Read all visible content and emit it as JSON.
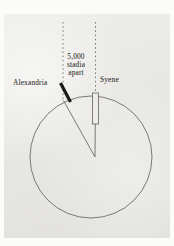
{
  "figure": {
    "name": "eratosthenes-earth-circumference-diagram",
    "type": "geometry-diagram",
    "background_color": "#e8e7e3",
    "ink_color": "#3b3b38"
  },
  "labels": {
    "alexandria": "Alexandria",
    "syene": "Syene",
    "distance_line1": "5,000",
    "distance_line2": "stadia",
    "distance_line3": "apart"
  },
  "diagram_data": {
    "earth_circle": {
      "center_x": 91,
      "center_y": 157,
      "radius": 61,
      "stroke": "#6e6c66",
      "stroke_width": 0.9,
      "fill": "none"
    },
    "sun_rays": [
      {
        "name": "sun-ray-alexandria",
        "x": 63,
        "y_top": 22,
        "y_bottom": 100,
        "style": "dotted"
      },
      {
        "name": "sun-ray-syene",
        "x": 95.5,
        "y_top": 22,
        "y_bottom": 124,
        "style": "dotted"
      }
    ],
    "angle_wedge": {
      "apex_x": 95,
      "apex_y": 157,
      "ray_alexandria": {
        "x": 63.5,
        "y": 100.5
      },
      "ray_syene": {
        "x": 95.5,
        "y": 96.5
      },
      "stroke": "#6e6c66"
    },
    "gnomon_alexandria": {
      "x1": 60.5,
      "y1": 83,
      "x2": 70.5,
      "y2": 102,
      "stroke": "#1a1a18",
      "stroke_width": 3.2,
      "note": "casts-shadow"
    },
    "gnomon_syene": {
      "x": 92.5,
      "y": 93,
      "width": 6,
      "height": 31,
      "stroke": "#6e6c66",
      "fill": "#edece8",
      "note": "vertical-well-no-shadow"
    }
  }
}
